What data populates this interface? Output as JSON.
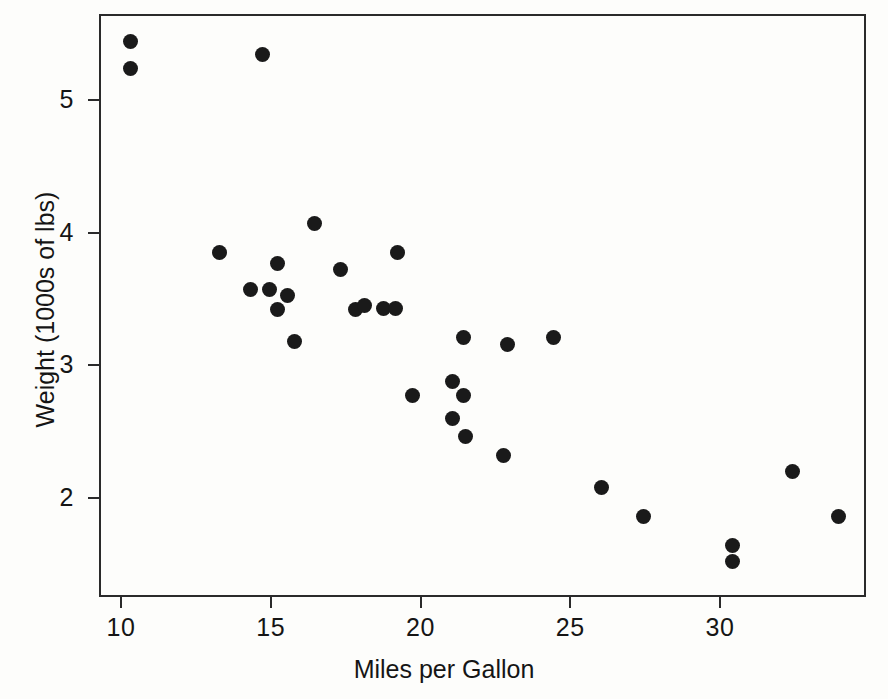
{
  "chart_data": {
    "type": "scatter",
    "title": "",
    "subtitle": "",
    "xlabel": "Miles per Gallon",
    "ylabel": "Weight (1000s of lbs)",
    "xlim": [
      9.3,
      34.9
    ],
    "ylim": [
      1.4,
      5.55
    ],
    "xticks": [
      10,
      15,
      20,
      25,
      30
    ],
    "yticks": [
      2,
      3,
      4,
      5
    ],
    "xticklabels": [
      "10",
      "15",
      "20",
      "25",
      "30"
    ],
    "yticklabels": [
      "2",
      "3",
      "4",
      "5"
    ],
    "grid": false,
    "legend": null,
    "marker": "filled-circle",
    "marker_color": "#1a1a1a",
    "frame_color": "#2a2a2a",
    "background_color": "#fdfdfb",
    "n_points": 32,
    "x": [
      10.33,
      10.33,
      14.73,
      16.47,
      19.23,
      13.3,
      15.23,
      17.33,
      14.33,
      14.97,
      15.57,
      15.23,
      17.83,
      18.13,
      18.77,
      19.17,
      15.8,
      21.43,
      22.9,
      24.43,
      19.73,
      21.07,
      21.43,
      21.07,
      21.5,
      22.77,
      26.03,
      27.43,
      30.43,
      30.43,
      32.43,
      33.94
    ],
    "y": [
      5.44,
      5.24,
      5.34,
      4.07,
      3.85,
      3.85,
      3.77,
      3.72,
      3.57,
      3.57,
      3.53,
      3.42,
      3.42,
      3.45,
      3.43,
      3.43,
      3.18,
      3.21,
      3.16,
      3.21,
      2.77,
      2.88,
      2.77,
      2.6,
      2.46,
      2.32,
      2.08,
      1.86,
      1.64,
      1.52,
      2.2,
      1.86
    ],
    "points": [
      {
        "x": 10.33,
        "y": 5.44
      },
      {
        "x": 10.33,
        "y": 5.24
      },
      {
        "x": 14.73,
        "y": 5.34
      },
      {
        "x": 16.47,
        "y": 4.07
      },
      {
        "x": 19.23,
        "y": 3.85
      },
      {
        "x": 13.3,
        "y": 3.85
      },
      {
        "x": 15.23,
        "y": 3.77
      },
      {
        "x": 17.33,
        "y": 3.72
      },
      {
        "x": 14.33,
        "y": 3.57
      },
      {
        "x": 14.97,
        "y": 3.57
      },
      {
        "x": 15.57,
        "y": 3.53
      },
      {
        "x": 15.23,
        "y": 3.42
      },
      {
        "x": 17.83,
        "y": 3.42
      },
      {
        "x": 18.13,
        "y": 3.45
      },
      {
        "x": 18.77,
        "y": 3.43
      },
      {
        "x": 19.17,
        "y": 3.43
      },
      {
        "x": 15.8,
        "y": 3.18
      },
      {
        "x": 21.43,
        "y": 3.21
      },
      {
        "x": 22.9,
        "y": 3.16
      },
      {
        "x": 24.43,
        "y": 3.21
      },
      {
        "x": 19.73,
        "y": 2.77
      },
      {
        "x": 21.07,
        "y": 2.88
      },
      {
        "x": 21.43,
        "y": 2.77
      },
      {
        "x": 21.07,
        "y": 2.6
      },
      {
        "x": 21.5,
        "y": 2.46
      },
      {
        "x": 22.77,
        "y": 2.32
      },
      {
        "x": 26.03,
        "y": 2.08
      },
      {
        "x": 27.43,
        "y": 1.86
      },
      {
        "x": 30.43,
        "y": 1.64
      },
      {
        "x": 30.43,
        "y": 1.52
      },
      {
        "x": 32.43,
        "y": 2.2
      },
      {
        "x": 33.94,
        "y": 1.86
      }
    ]
  }
}
